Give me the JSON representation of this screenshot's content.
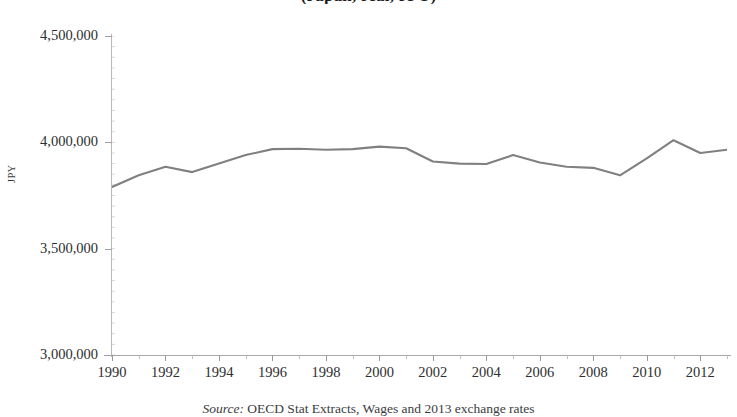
{
  "figure": {
    "title": "(Japan, real, JPY)",
    "source_label": "Source:",
    "source_text": "OECD Stat Extracts, Wages and 2013 exchange rates"
  },
  "axes": {
    "y_axis_title": "JPY",
    "y_tick_labels": [
      "4,500,000",
      "4,000,000",
      "3,500,000",
      "3,000,000"
    ],
    "x_tick_labels": [
      "1990",
      "1992",
      "1994",
      "1996",
      "1998",
      "2000",
      "2002",
      "2004",
      "2006",
      "2008",
      "2010",
      "2012"
    ]
  },
  "style": {
    "line_color": "#808080",
    "axis_color": "#a8a8a8",
    "background": "#ffffff",
    "text_color": "#2e2e2e"
  },
  "chart_data": {
    "type": "line",
    "title": "(Japan, real, JPY)",
    "xlabel": "",
    "ylabel": "JPY",
    "ylim": [
      3000000,
      4500000
    ],
    "xlim": [
      1990,
      2013
    ],
    "ytick_step": 500000,
    "grid": false,
    "legend": "none",
    "x": [
      1990,
      1991,
      1992,
      1993,
      1994,
      1995,
      1996,
      1997,
      1998,
      1999,
      2000,
      2001,
      2002,
      2003,
      2004,
      2005,
      2006,
      2007,
      2008,
      2009,
      2010,
      2011,
      2012,
      2013
    ],
    "series": [
      {
        "name": "Average annual wages",
        "values": [
          3790000,
          3845000,
          3885000,
          3860000,
          3900000,
          3940000,
          3968000,
          3970000,
          3965000,
          3968000,
          3980000,
          3972000,
          3910000,
          3900000,
          3898000,
          3940000,
          3905000,
          3885000,
          3880000,
          3845000,
          3925000,
          4010000,
          3950000,
          3965000
        ]
      }
    ],
    "x_tick_values": [
      1990,
      1992,
      1994,
      1996,
      1998,
      2000,
      2002,
      2004,
      2006,
      2008,
      2010,
      2012
    ],
    "y_tick_values": [
      3000000,
      3500000,
      4000000,
      4500000
    ]
  }
}
